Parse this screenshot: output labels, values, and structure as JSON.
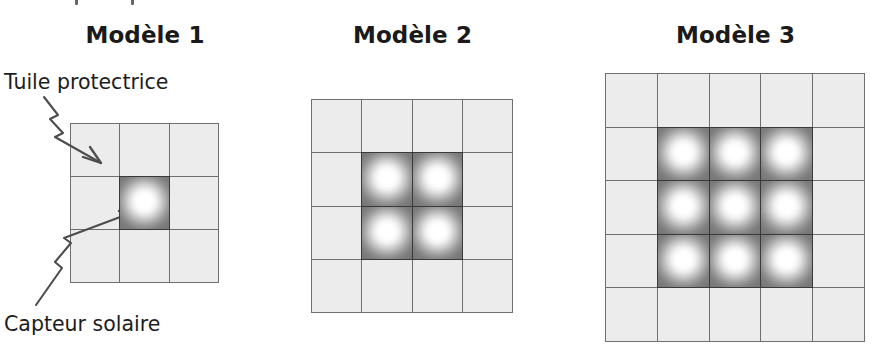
{
  "figure": {
    "caption_fragment_above": "",
    "background_color": "#ffffff",
    "tile_fill_color": "#ececec",
    "tile_border_color": "#6f6f6f",
    "collector_border_color": "#3a3a3a",
    "collector_center_color": "#ffffff",
    "collector_edge_color": "#757575",
    "text_color": "#1b1b1b"
  },
  "models": [
    {
      "title": "Modèle 1",
      "grid_columns": 3,
      "grid_rows": 3,
      "total_tiles": 9,
      "collector_block_columns": 1,
      "collector_block_rows": 1,
      "collector_count": 1,
      "protective_tile_count": 8
    },
    {
      "title": "Modèle 2",
      "grid_columns": 4,
      "grid_rows": 4,
      "total_tiles": 16,
      "collector_block_columns": 2,
      "collector_block_rows": 2,
      "collector_count": 4,
      "protective_tile_count": 12
    },
    {
      "title": "Modèle 3",
      "grid_columns": 5,
      "grid_rows": 5,
      "total_tiles": 25,
      "collector_block_columns": 3,
      "collector_block_rows": 3,
      "collector_count": 9,
      "protective_tile_count": 16
    }
  ],
  "annotations": [
    {
      "label": "Tuile protectrice",
      "points_to": "top-left protective tile of Modèle 1",
      "arrow_style": "zigzag-arrow"
    },
    {
      "label": "Capteur solaire",
      "points_to": "center solar collector of Modèle 1",
      "arrow_style": "zigzag-arrow"
    }
  ]
}
